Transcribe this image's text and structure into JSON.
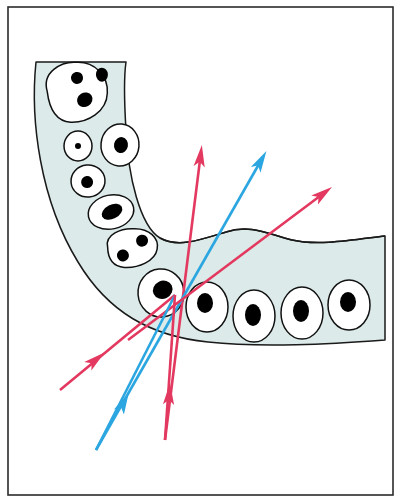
{
  "figure": {
    "frame": {
      "border_color": "#2b2b2b",
      "border_width": 1.6,
      "background": "#ffffff",
      "x": 8,
      "y": 7,
      "width": 385,
      "height": 488
    },
    "palette": {
      "tissue_fill": "#dcebea",
      "tissue_stroke": "#1a1a1a",
      "cell_fill": "#ffffff",
      "cell_stroke": "#111111",
      "nucleus_fill": "#000000",
      "arrow_pink": "#e3385f",
      "arrow_blue": "#2ba6e0"
    },
    "tissue": {
      "name": "epithelium-band",
      "description": "L-shaped band of tissue, descending from upper-left then turning to the right",
      "outline_path": "M 36,62 C 30,120 40,200 78,262 C 108,312 150,336 208,342 C 262,348 330,344 385,340 L 385,236 C 352,240 318,246 292,240 C 268,234 250,224 226,232 C 200,240 178,248 160,238 C 140,226 128,176 126,130 C 124,98 124,76 126,62 Z"
    },
    "boundary_waves": [
      {
        "name": "upper-inner-wave",
        "path": "M 160,238 C 178,248 200,240 226,232 C 250,224 268,234 292,240 C 318,246 352,240 385,236"
      }
    ],
    "cells": [
      {
        "name": "cell-multinucleate-top",
        "cx": 78,
        "cy": 92,
        "rx": 30,
        "ry": 28,
        "rot": -12,
        "shape": "lobed",
        "nuclei": [
          {
            "cx": 80,
            "cy": 78,
            "rx": 6,
            "ry": 6,
            "rot": 0
          },
          {
            "cx": 105,
            "cy": 80,
            "rx": 6,
            "ry": 7,
            "rot": 10
          },
          {
            "cx": 83,
            "cy": 101,
            "rx": 8,
            "ry": 7,
            "rot": -20
          }
        ]
      },
      {
        "name": "cell-small-left",
        "cx": 78,
        "cy": 146,
        "rx": 14,
        "ry": 15,
        "rot": 0,
        "shape": "oval",
        "nuclei": [
          {
            "cx": 78,
            "cy": 146,
            "rx": 3,
            "ry": 3,
            "rot": 0
          }
        ]
      },
      {
        "name": "cell-right-upper",
        "cx": 120,
        "cy": 145,
        "rx": 19,
        "ry": 21,
        "rot": 5,
        "shape": "oval",
        "nuclei": [
          {
            "cx": 121,
            "cy": 145,
            "rx": 7,
            "ry": 8,
            "rot": 5
          }
        ]
      },
      {
        "name": "cell-left-mid",
        "cx": 88,
        "cy": 181,
        "rx": 17,
        "ry": 16,
        "rot": -5,
        "shape": "oval",
        "nuclei": [
          {
            "cx": 87,
            "cy": 182,
            "rx": 6,
            "ry": 6,
            "rot": 0
          }
        ]
      },
      {
        "name": "cell-elongated",
        "cx": 111,
        "cy": 212,
        "rx": 23,
        "ry": 17,
        "rot": -12,
        "shape": "oval",
        "nuclei": [
          {
            "cx": 112,
            "cy": 212,
            "rx": 11,
            "ry": 7,
            "rot": -15
          }
        ]
      },
      {
        "name": "cell-binucleate",
        "cx": 133,
        "cy": 248,
        "rx": 25,
        "ry": 18,
        "rot": -8,
        "shape": "lobed",
        "nuclei": [
          {
            "cx": 122,
            "cy": 254,
            "rx": 6,
            "ry": 6,
            "rot": 0
          },
          {
            "cx": 143,
            "cy": 242,
            "rx": 6,
            "ry": 6,
            "rot": 0
          }
        ]
      },
      {
        "name": "cell-corner-large",
        "cx": 161,
        "cy": 293,
        "rx": 23,
        "ry": 24,
        "rot": -5,
        "shape": "oval",
        "nuclei": [
          {
            "cx": 163,
            "cy": 290,
            "rx": 10,
            "ry": 9,
            "rot": -20
          }
        ]
      },
      {
        "name": "cell-bottom-1",
        "cx": 207,
        "cy": 307,
        "rx": 21,
        "ry": 25,
        "rot": 0,
        "shape": "oval",
        "nuclei": [
          {
            "cx": 205,
            "cy": 303,
            "rx": 8,
            "ry": 10,
            "rot": 0
          }
        ]
      },
      {
        "name": "cell-bottom-2",
        "cx": 254,
        "cy": 316,
        "rx": 21,
        "ry": 26,
        "rot": 0,
        "shape": "oval",
        "nuclei": [
          {
            "cx": 253,
            "cy": 315,
            "rx": 8,
            "ry": 11,
            "rot": 0
          }
        ]
      },
      {
        "name": "cell-bottom-3",
        "cx": 302,
        "cy": 313,
        "rx": 21,
        "ry": 26,
        "rot": 0,
        "shape": "oval",
        "nuclei": [
          {
            "cx": 301,
            "cy": 311,
            "rx": 8,
            "ry": 11,
            "rot": 0
          }
        ]
      },
      {
        "name": "cell-bottom-4",
        "cx": 349,
        "cy": 305,
        "rx": 21,
        "ry": 25,
        "rot": 0,
        "shape": "oval",
        "nuclei": [
          {
            "cx": 348,
            "cy": 302,
            "rx": 8,
            "ry": 10,
            "rot": 0
          }
        ]
      }
    ],
    "arrows": [
      {
        "name": "arrow-pink-vertical",
        "color_key": "arrow_pink",
        "tail": {
          "x": 165,
          "y": 440
        },
        "tip": {
          "x": 200,
          "y": 160
        },
        "head_at": {
          "x": 200,
          "y": 160
        },
        "mid_head": null
      },
      {
        "name": "arrow-blue-steep",
        "color_key": "arrow_blue",
        "tail": {
          "x": 96,
          "y": 450
        },
        "tip": {
          "x": 259,
          "y": 164
        },
        "head_at": {
          "x": 259,
          "y": 164
        },
        "mid_head": null
      },
      {
        "name": "arrow-pink-shallow-right",
        "color_key": "arrow_pink",
        "tail": {
          "x": 128,
          "y": 340
        },
        "tip": {
          "x": 320,
          "y": 196
        },
        "head_at": {
          "x": 320,
          "y": 196
        },
        "mid_head": null
      },
      {
        "name": "arrow-pink-upper-left",
        "color_key": "arrow_pink",
        "tail": {
          "x": 60,
          "y": 390
        },
        "tip": {
          "x": 175,
          "y": 295
        },
        "head_at": {
          "x": 93,
          "y": 362
        },
        "mid_head": true
      },
      {
        "name": "arrow-blue-lower-left",
        "color_key": "arrow_blue",
        "tail": {
          "x": 96,
          "y": 450
        },
        "tip": {
          "x": 175,
          "y": 295
        },
        "head_at": {
          "x": 122,
          "y": 406
        },
        "mid_head": true
      },
      {
        "name": "arrow-pink-lower-center",
        "color_key": "arrow_pink",
        "tail": {
          "x": 165,
          "y": 440
        },
        "tip": {
          "x": 175,
          "y": 295
        },
        "head_at": {
          "x": 169,
          "y": 398
        },
        "mid_head": true
      }
    ],
    "convergence_point": {
      "x": 175,
      "y": 295
    }
  }
}
